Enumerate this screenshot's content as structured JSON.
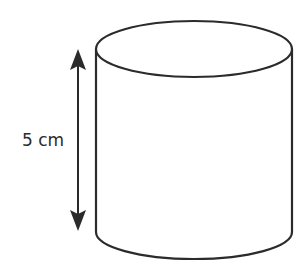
{
  "diagram": {
    "shape": "cylinder",
    "height_label": "5 cm",
    "colors": {
      "stroke": "#2b2b2b",
      "fill": "#ffffff",
      "arrow": "#2b2b2b"
    }
  }
}
